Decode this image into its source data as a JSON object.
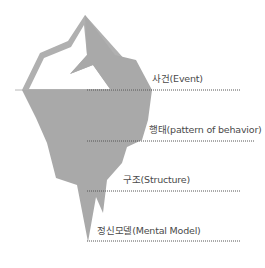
{
  "diagram": {
    "colors": {
      "iceberg": "#a9a9a9",
      "outline": "#b0b0b0",
      "ice_top": "#ffffff",
      "dotted_line": "#555555",
      "text": "#4a4a4a"
    },
    "levels": [
      {
        "label": "사건(Event)",
        "x": 152,
        "y": 73,
        "line_y": 90,
        "line_x1": 87,
        "line_x2": 240
      },
      {
        "label": "행태(pattern of behavior)",
        "x": 149,
        "y": 124,
        "line_y": 141,
        "line_x1": 87,
        "line_x2": 255
      },
      {
        "label": "구조(Structure)",
        "x": 123,
        "y": 174,
        "line_y": 191,
        "line_x1": 87,
        "line_x2": 240
      },
      {
        "label": "정신모델(Mental Model)",
        "x": 97,
        "y": 225,
        "line_y": 241,
        "line_x1": 87,
        "line_x2": 240
      }
    ]
  }
}
